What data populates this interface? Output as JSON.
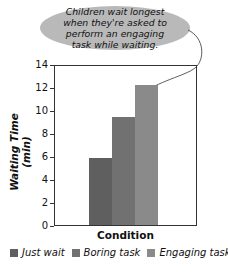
{
  "annotation": {
    "text": "Children wait longest when they're asked to perform an engaging task while waiting."
  },
  "chart_data": {
    "type": "bar",
    "title": "",
    "xlabel": "Condition",
    "ylabel": "Waiting Time (min)",
    "ylim": [
      0,
      14
    ],
    "yticks": [
      0,
      2,
      4,
      6,
      8,
      10,
      12,
      14
    ],
    "categories": [
      "Just wait",
      "Boring task",
      "Engaging task"
    ],
    "values": [
      5.9,
      9.5,
      12.3
    ],
    "colors": [
      "#5f5f5f",
      "#717171",
      "#8a8a8a"
    ],
    "legend": [
      "Just wait",
      "Boring task",
      "Engaging task"
    ],
    "legend_position": "bottom",
    "grid": false,
    "annotations": [
      "Children wait longest when they're asked to perform an engaging task while waiting."
    ]
  },
  "axis": {
    "ticks": [
      "0",
      "2",
      "4",
      "6",
      "8",
      "10",
      "12",
      "14"
    ]
  },
  "labels": {
    "x": "Condition",
    "y": "Waiting Time (min)"
  },
  "legend": [
    {
      "label": "Just wait",
      "color": "#5f5f5f"
    },
    {
      "label": "Boring task",
      "color": "#717171"
    },
    {
      "label": "Engaging task",
      "color": "#8a8a8a"
    }
  ]
}
